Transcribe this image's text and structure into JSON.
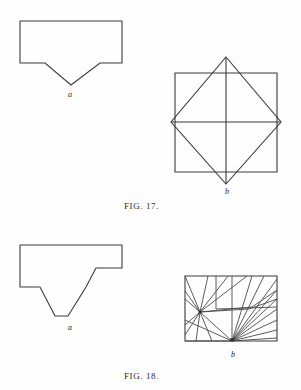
{
  "page": {
    "background_color": "#fefefe",
    "ink_color": "#3a3a3a",
    "width": 301,
    "height": 390
  },
  "figures": [
    {
      "id": "fig-17",
      "caption": "FIG. 17.",
      "caption_position": {
        "x": 124,
        "y": 202
      },
      "panels": [
        {
          "id": "fig-17-a",
          "label": "a",
          "label_position": {
            "x": 68,
            "y": 91
          },
          "description": "rectangle with V-shaped notch cut from bottom edge",
          "outline": [
            [
              20,
              21
            ],
            [
              122,
              21
            ],
            [
              122,
              63
            ],
            [
              100,
              63
            ],
            [
              71,
              85
            ],
            [
              45,
              63
            ],
            [
              20,
              63
            ]
          ]
        },
        {
          "id": "fig-17-b",
          "label": "b",
          "label_position": {
            "x": 225,
            "y": 188
          },
          "description": "eight-pointed star: square overlaid with rotated square plus cross diagonals",
          "square": [
            [
              175,
              73
            ],
            [
              277,
              73
            ],
            [
              277,
              172
            ],
            [
              175,
              172
            ]
          ],
          "diamond": [
            [
              226,
              57
            ],
            [
              281,
              122
            ],
            [
              226,
              184
            ],
            [
              171,
              122
            ]
          ],
          "diagonals": [
            [
              [
                226,
                57
              ],
              [
                226,
                184
              ]
            ],
            [
              [
                171,
                122
              ],
              [
                281,
                122
              ]
            ]
          ]
        }
      ]
    },
    {
      "id": "fig-18",
      "caption": "FIG. 18.",
      "caption_position": {
        "x": 124,
        "y": 372
      },
      "panels": [
        {
          "id": "fig-18-a",
          "label": "a",
          "label_position": {
            "x": 68,
            "y": 324
          },
          "description": "stepped polygon with deep notch cut from bottom edge",
          "outline": [
            [
              20,
              245
            ],
            [
              122,
              245
            ],
            [
              122,
              268
            ],
            [
              96,
              268
            ],
            [
              86,
              287
            ],
            [
              68,
              316
            ],
            [
              55,
              316
            ],
            [
              40,
              287
            ],
            [
              20,
              287
            ]
          ]
        },
        {
          "id": "fig-18-b",
          "label": "b",
          "label_position": {
            "x": 231,
            "y": 351
          },
          "description": "rectangle subdivided by lines radiating from two fan points",
          "rect": [
            [
              185,
              276
            ],
            [
              277,
              276
            ],
            [
              277,
              341
            ],
            [
              185,
              341
            ]
          ],
          "fan_points": [
            {
              "name": "left-fan",
              "x": 200,
              "y": 312
            },
            {
              "name": "bottom-fan",
              "x": 232,
              "y": 341,
              "marked": true
            }
          ],
          "left_fan_rays": [
            [
              185,
              276
            ],
            [
              208,
              276
            ],
            [
              228,
              276
            ],
            [
              247,
              276
            ],
            [
              185,
              291
            ],
            [
              185,
              299
            ],
            [
              185,
              325
            ],
            [
              185,
              335
            ],
            [
              196,
              341
            ],
            [
              212,
              341
            ],
            [
              232,
              341
            ],
            [
              249,
              309
            ],
            [
              252,
              307
            ]
          ],
          "bottom_fan_rays": [
            [
              232,
              276
            ],
            [
              252,
              276
            ],
            [
              264,
              276
            ],
            [
              277,
              279
            ],
            [
              277,
              290
            ],
            [
              277,
              299
            ],
            [
              277,
              309
            ],
            [
              277,
              320
            ],
            [
              277,
              330
            ],
            [
              277,
              338
            ],
            [
              200,
              312
            ],
            [
              185,
              341
            ]
          ],
          "cross_lines": [
            [
              [
                249,
                309
              ],
              [
                277,
                299
              ]
            ],
            [
              [
                252,
                307
              ],
              [
                277,
                290
              ]
            ],
            [
              [
                216,
                309
              ],
              [
                277,
                307
              ]
            ],
            [
              [
                216,
                276
              ],
              [
                216,
                309
              ]
            ],
            [
              [
                185,
                320
              ],
              [
                232,
                341
              ]
            ]
          ]
        }
      ]
    }
  ]
}
